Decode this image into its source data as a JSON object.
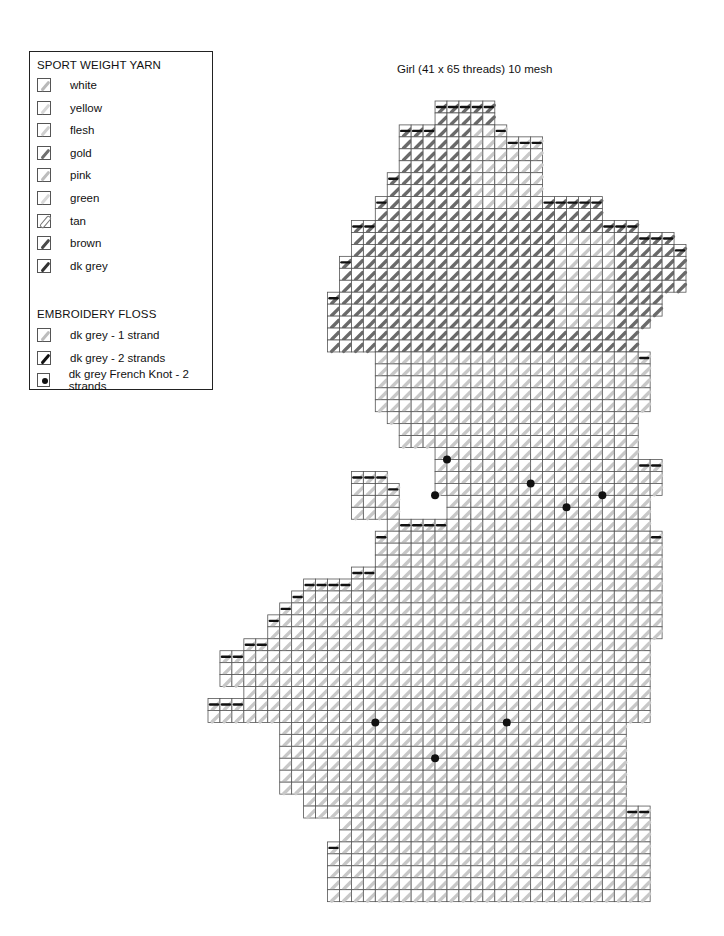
{
  "legend": {
    "yarn_heading": "SPORT WEIGHT YARN",
    "yarn": [
      {
        "label": "white",
        "swatch": "stroke",
        "color": "#b9b9b9"
      },
      {
        "label": "yellow",
        "swatch": "stroke",
        "color": "#d6d6d6"
      },
      {
        "label": "flesh",
        "swatch": "stroke",
        "color": "#cfcfcf"
      },
      {
        "label": "gold",
        "swatch": "stroke",
        "color": "#6f6f6f"
      },
      {
        "label": "pink",
        "swatch": "stroke",
        "color": "#bdbdbd"
      },
      {
        "label": "green",
        "swatch": "stroke",
        "color": "#d8d8d8"
      },
      {
        "label": "tan",
        "swatch": "ring",
        "color": "#ffffff"
      },
      {
        "label": "brown",
        "swatch": "stroke",
        "color": "#4a4a4a"
      },
      {
        "label": "dk grey",
        "swatch": "stroke",
        "color": "#333333"
      }
    ],
    "floss_heading": "EMBROIDERY FLOSS",
    "floss": [
      {
        "label": "dk grey - 1 strand",
        "swatch": "stroke",
        "color": "#bdbdbd"
      },
      {
        "label": "dk grey - 2 strands",
        "swatch": "stroke",
        "color": "#111111"
      },
      {
        "label": "dk grey French Knot - 2 strands",
        "swatch": "dot",
        "color": "#111111"
      }
    ]
  },
  "pattern": {
    "title": "Girl (41 x 65 threads) 10 mesh",
    "threads_wide": 41,
    "threads_high": 65,
    "mesh": 10,
    "colors": {
      "grid_line": "#555555",
      "light_stitch": "#c8c8c8",
      "dark_stitch": "#6a6a6a",
      "outline": "#111111",
      "backstitch_light": "#8a8a8a"
    },
    "french_knots": [
      [
        20,
        30
      ],
      [
        19,
        33
      ],
      [
        27,
        32
      ],
      [
        33,
        33
      ],
      [
        30,
        34
      ],
      [
        14,
        52
      ],
      [
        25,
        52
      ],
      [
        19,
        55
      ]
    ]
  }
}
